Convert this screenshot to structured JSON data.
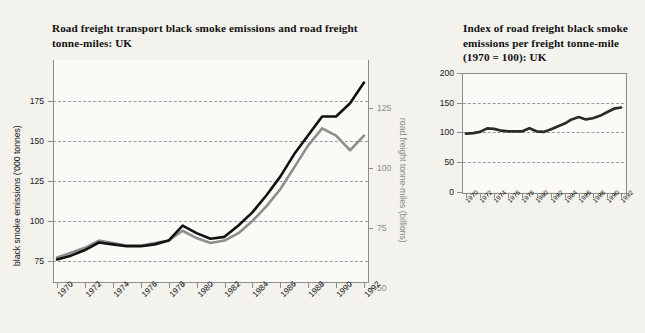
{
  "background_color": "#f4f2ed",
  "charts": {
    "left": {
      "title": "Road freight transport black smoke emissions and road freight tonne-miles: UK",
      "y_left_title": "black smoke emissions ('000 tonnes)",
      "y_right_title": "road freight tonne-miles (billions)",
      "y_left_ticks": [
        "175",
        "150",
        "125",
        "100",
        "75"
      ],
      "y_right_ticks": [
        "125",
        "100",
        "75",
        "50"
      ],
      "x_ticks": [
        "1970",
        "1972",
        "1974",
        "1976",
        "1978",
        "1980",
        "1982",
        "1984",
        "1986",
        "1988",
        "1990",
        "1992"
      ]
    },
    "right": {
      "title": "Index of road freight black smoke emissions per freight tonne-mile (1970 = 100): UK",
      "y_ticks": [
        "200",
        "150",
        "100",
        "50",
        "0"
      ],
      "x_ticks": [
        "1970",
        "1972",
        "1974",
        "1976",
        "1978",
        "1980",
        "1982",
        "1984",
        "1986",
        "1988",
        "1990",
        "1992"
      ]
    }
  },
  "chart_data": [
    {
      "type": "line",
      "id": "left-chart",
      "title": "Road freight transport black smoke emissions and road freight tonne-miles: UK",
      "xlabel": "",
      "ylabel": "black smoke emissions ('000 tonnes)",
      "y2label": "road freight tonne-miles (billions)",
      "grid": true,
      "legend": "none",
      "x": [
        1970,
        1971,
        1972,
        1973,
        1974,
        1975,
        1976,
        1977,
        1978,
        1979,
        1980,
        1981,
        1982,
        1983,
        1984,
        1985,
        1986,
        1987,
        1988,
        1989,
        1990,
        1991,
        1992
      ],
      "xlim": [
        1970,
        1992
      ],
      "ylim": [
        62,
        180
      ],
      "y2lim": [
        41,
        132
      ],
      "series": [
        {
          "name": "black smoke emissions ('000 tonnes)",
          "axis": "left",
          "color": "#111111",
          "values": [
            74,
            76,
            79,
            83,
            82,
            81,
            81,
            82,
            84,
            92,
            88,
            85,
            86,
            92,
            99,
            108,
            118,
            130,
            140,
            150,
            150,
            157,
            168
          ]
        },
        {
          "name": "road freight tonne-miles (billions)",
          "axis": "right",
          "color": "#8e8e8e",
          "values": [
            51,
            53,
            55,
            58,
            57,
            56,
            56,
            57,
            58,
            62,
            59,
            57,
            58,
            61,
            66,
            72,
            79,
            88,
            97,
            104,
            101,
            95,
            101
          ]
        }
      ]
    },
    {
      "type": "line",
      "id": "right-chart",
      "title": "Index of road freight black smoke emissions per freight tonne-mile (1970 = 100): UK",
      "xlabel": "",
      "ylabel": "",
      "grid": true,
      "legend": "none",
      "x": [
        1970,
        1971,
        1972,
        1973,
        1974,
        1975,
        1976,
        1977,
        1978,
        1979,
        1980,
        1981,
        1982,
        1983,
        1984,
        1985,
        1986,
        1987,
        1988,
        1989,
        1990,
        1991,
        1992
      ],
      "xlim": [
        1970,
        1992
      ],
      "ylim": [
        0,
        200
      ],
      "series": [
        {
          "name": "Index of black smoke emissions per freight tonne-mile (1970 = 100)",
          "color": "#2b2b2b",
          "values": [
            98,
            99,
            101,
            107,
            106,
            103,
            102,
            102,
            102,
            107,
            102,
            101,
            105,
            110,
            115,
            122,
            126,
            122,
            124,
            128,
            134,
            140,
            142
          ]
        }
      ]
    }
  ]
}
